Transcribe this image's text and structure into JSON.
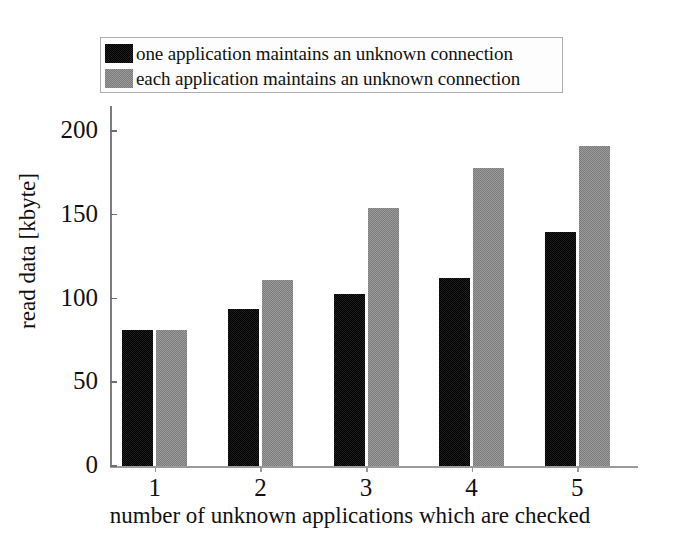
{
  "chart_data": {
    "type": "bar",
    "title": "",
    "xlabel": "number of unknown applications which are checked",
    "ylabel": "read data [kbyte]",
    "categories": [
      "1",
      "2",
      "3",
      "4",
      "5"
    ],
    "ylim": [
      0,
      215
    ],
    "yticks": [
      0,
      50,
      100,
      150,
      200
    ],
    "ytick_labels": [
      "0",
      "50",
      "100",
      "150",
      "200"
    ],
    "grid": false,
    "legend_position": "top",
    "series": [
      {
        "name": "one application maintains an unknown connection",
        "color": "#1d1d1d",
        "pattern": "dark-dither",
        "values": [
          81,
          94,
          103,
          112,
          140
        ]
      },
      {
        "name": "each application maintains an unknown connection",
        "color": "#9a9a9a",
        "pattern": "light-checker",
        "values": [
          81,
          111,
          154,
          178,
          191
        ]
      }
    ]
  },
  "legend": {
    "items": [
      {
        "label": "one application maintains an unknown connection",
        "swatch": "dark-swatch"
      },
      {
        "label": "each application maintains an unknown connection",
        "swatch": "light-swatch"
      }
    ]
  },
  "colors": {
    "dark_series": "#1d1d1d",
    "light_series": "#9a9a9a",
    "axis": "#8a8a8a",
    "text": "#111111",
    "background": "#ffffff",
    "legend_border": "#aeaeae"
  }
}
